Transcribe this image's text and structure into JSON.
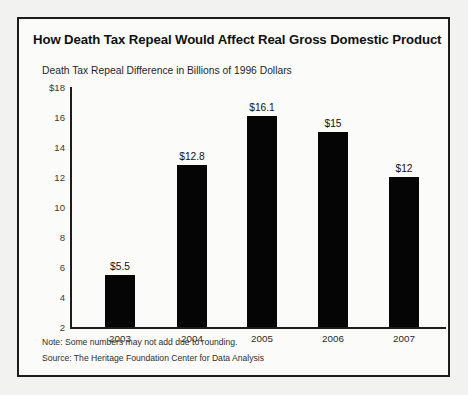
{
  "figure": {
    "title": "How Death Tax Repeal Would Affect Real Gross Domestic Product",
    "subtitle": "Death Tax Repeal Difference in Billions of 1996 Dollars",
    "note": "Note: Some numbers may not add due to rounding.",
    "source": "Source: The Heritage Foundation Center for Data Analysis",
    "border_color": "#1c1c1c",
    "bar_color": "#050505",
    "background_color": "#fbfbf9"
  },
  "chart_data": {
    "type": "bar",
    "title": "How Death Tax Repeal Would Affect Real Gross Domestic Product",
    "subtitle": "Death Tax Repeal Difference in Billions of 1996 Dollars",
    "xlabel": "",
    "ylabel": "Death Tax Repeal Difference in Billions of 1996 Dollars",
    "categories": [
      "2003",
      "2004",
      "2005",
      "2006",
      "2007"
    ],
    "values": [
      5.5,
      12.8,
      16.1,
      15,
      12
    ],
    "data_labels": [
      "$5.5",
      "$12.8",
      "$16.1",
      "$15",
      "$12"
    ],
    "ylim": [
      2,
      18
    ],
    "yticks": [
      2,
      4,
      6,
      8,
      10,
      12,
      14,
      16,
      18
    ],
    "ytick_labels": [
      "2",
      "4",
      "6",
      "8",
      "10",
      "12",
      "14",
      "16",
      "$18"
    ],
    "grid": false,
    "legend": null,
    "series": [
      {
        "name": "Death Tax Repeal Difference",
        "values": [
          5.5,
          12.8,
          16.1,
          15,
          12
        ]
      }
    ]
  }
}
